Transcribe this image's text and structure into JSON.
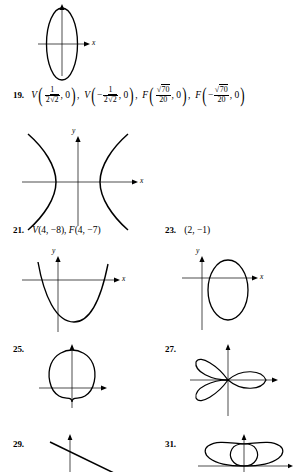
{
  "page": {
    "background_color": "#ffffff",
    "ink_color": "#000000",
    "width": 302,
    "height": 469
  },
  "answers": [
    {
      "number": "19.",
      "kind": "coordinates",
      "parts": [
        {
          "point_label": "V",
          "x_numerator": "1",
          "x_denominator": "2√2",
          "x_sign": "",
          "y": "0"
        },
        {
          "point_label": "V",
          "x_numerator": "1",
          "x_denominator": "2√2",
          "x_sign": "−",
          "y": "0"
        },
        {
          "point_label": "F",
          "x_numerator": "√70",
          "x_denominator": "20",
          "x_sign": "",
          "y": "0"
        },
        {
          "point_label": "F",
          "x_numerator": "√70",
          "x_denominator": "20",
          "x_sign": "−",
          "y": "0"
        }
      ],
      "plain_text": "19. V(1/(2√2), 0), V(−1/(2√2), 0), F(√70/20, 0), F(−√70/20, 0)"
    },
    {
      "number": "21.",
      "kind": "coordinates",
      "plain_text": "V(4, −8), F(4, −7)",
      "tokens": [
        {
          "label": "V",
          "value": "(4, −8)"
        },
        {
          "label": "F",
          "value": "(4, −7)"
        }
      ]
    },
    {
      "number": "23.",
      "kind": "coordinates",
      "plain_text": "(2, −1)",
      "tokens": [
        {
          "label": "",
          "value": "(2, −1)"
        }
      ]
    },
    {
      "number": "25.",
      "kind": "graph",
      "curve": "cardioid"
    },
    {
      "number": "27.",
      "kind": "graph",
      "curve": "three-petal-rose"
    },
    {
      "number": "29.",
      "kind": "graph",
      "curve": "line-negative-slope"
    },
    {
      "number": "31.",
      "kind": "graph",
      "curve": "limacon-inner-loop"
    }
  ],
  "graphs": [
    {
      "id": "ellipse-vertical-top",
      "curve_type": "ellipse",
      "orientation": "vertical",
      "centered_at_origin": true,
      "x_axis_label": "x",
      "y_axis_label": "",
      "semi_axis_x": 16,
      "semi_axis_y": 42
    },
    {
      "id": "hyperbola-horizontal",
      "curve_type": "hyperbola",
      "orientation": "horizontal",
      "x_axis_label": "x",
      "y_axis_label": "y",
      "branches": 2
    },
    {
      "id": "parabola-up",
      "curve_type": "parabola",
      "opens": "up",
      "vertex_below_x_axis": true,
      "x_axis_label": "x",
      "y_axis_label": "y"
    },
    {
      "id": "ellipse-shifted-right",
      "curve_type": "ellipse",
      "orientation": "vertical",
      "centered_at_origin": false,
      "x_axis_label": "x",
      "y_axis_label": "y"
    },
    {
      "id": "cardioid-up",
      "curve_type": "cardioid",
      "pointing": "up",
      "x_axis_label": "",
      "y_axis_label": ""
    },
    {
      "id": "rose-three-petal",
      "curve_type": "rose",
      "petals": 3,
      "x_axis_label": "",
      "y_axis_label": ""
    },
    {
      "id": "line-negative-slope",
      "curve_type": "line",
      "slope_sign": "negative",
      "x_axis_label": "",
      "y_axis_label": ""
    },
    {
      "id": "limacon-inner-loop",
      "curve_type": "limacon",
      "has_inner_loop": true,
      "x_axis_label": "",
      "y_axis_label": ""
    }
  ],
  "axis_labels": {
    "x": "x",
    "y": "y"
  }
}
